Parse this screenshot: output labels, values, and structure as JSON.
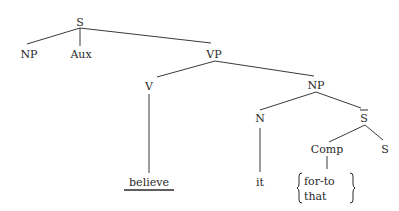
{
  "diagram": {
    "type": "syntax-tree",
    "nodes": {
      "s_root": "S",
      "np_subject": "NP",
      "aux": "Aux",
      "vp": "VP",
      "v": "V",
      "np_object": "NP",
      "n": "N",
      "s_bar": "S",
      "comp": "Comp",
      "s_embedded": "S",
      "believe": "believe",
      "it": "it",
      "comp_option_1": "for-to",
      "comp_option_2": "that"
    },
    "edges": [
      [
        "S",
        "NP"
      ],
      [
        "S",
        "Aux"
      ],
      [
        "S",
        "VP"
      ],
      [
        "VP",
        "V"
      ],
      [
        "VP",
        "NP"
      ],
      [
        "V",
        "believe"
      ],
      [
        "NP",
        "N"
      ],
      [
        "NP",
        "S-bar"
      ],
      [
        "N",
        "it"
      ],
      [
        "S-bar",
        "Comp"
      ],
      [
        "S-bar",
        "S"
      ],
      [
        "Comp",
        "{for-to | that}"
      ]
    ]
  }
}
